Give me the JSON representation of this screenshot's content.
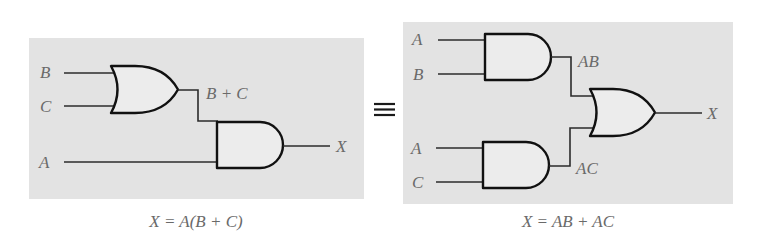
{
  "left_circuit": {
    "inputs": [
      "B",
      "C",
      "A"
    ],
    "intermediate_label": "B + C",
    "output_label": "X",
    "gates": [
      "OR(B,C)",
      "AND(B+C,A)"
    ],
    "caption": "X = A(B + C)"
  },
  "equivalence_symbol": "≡",
  "right_circuit": {
    "inputs": [
      "A",
      "B",
      "A",
      "C"
    ],
    "intermediate_labels": [
      "AB",
      "AC"
    ],
    "output_label": "X",
    "gates": [
      "AND(A,B)",
      "AND(A,C)",
      "OR(AB,AC)"
    ],
    "caption": "X = AB + AC"
  },
  "colors": {
    "panel_bg": "#e3e3e3",
    "gate_fill": "#ececec",
    "stroke": "#111111",
    "label_text": "#6a6a6a"
  }
}
